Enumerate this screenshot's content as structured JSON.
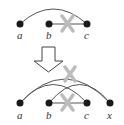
{
  "top_graph": {
    "nodes": [
      {
        "id": "a",
        "label": "a"
      },
      {
        "id": "b",
        "label": "b"
      },
      {
        "id": "c",
        "label": "c"
      }
    ],
    "edges": [
      {
        "from": "a",
        "to": "c",
        "type": "arc",
        "deleted": false
      },
      {
        "from": "b",
        "to": "c",
        "type": "straight",
        "deleted": true
      }
    ]
  },
  "arrow": {
    "direction": "down"
  },
  "bottom_graph": {
    "nodes": [
      {
        "id": "a",
        "label": "a"
      },
      {
        "id": "b",
        "label": "b"
      },
      {
        "id": "c",
        "label": "c"
      },
      {
        "id": "x",
        "label": "x"
      }
    ],
    "edges": [
      {
        "from": "a",
        "to": "x",
        "type": "arc",
        "deleted": true
      },
      {
        "from": "a",
        "to": "c",
        "type": "arc",
        "deleted": false
      },
      {
        "from": "b",
        "to": "x",
        "type": "arc",
        "deleted": false
      },
      {
        "from": "b",
        "to": "c",
        "type": "straight",
        "deleted": true
      }
    ]
  },
  "colors": {
    "node": "#1a1a1a",
    "edge": "#555555",
    "cross": "#b8b8b8",
    "arrow": "#444444"
  }
}
